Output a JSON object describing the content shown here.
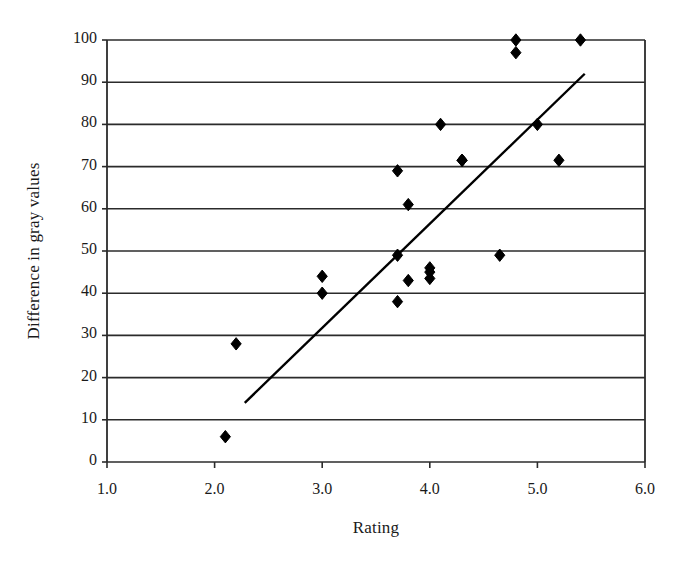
{
  "chart_data": {
    "type": "scatter",
    "title": "",
    "xlabel": "Rating",
    "ylabel": "Difference in gray values",
    "xlim": [
      1.0,
      6.0
    ],
    "ylim": [
      0,
      100
    ],
    "xticks": [
      "1.0",
      "2.0",
      "3.0",
      "4.0",
      "5.0",
      "6.0"
    ],
    "xtick_values": [
      1.0,
      2.0,
      3.0,
      4.0,
      5.0,
      6.0
    ],
    "yticks": [
      "0",
      "10",
      "20",
      "30",
      "40",
      "50",
      "60",
      "70",
      "80",
      "90",
      "100"
    ],
    "ytick_values": [
      0,
      10,
      20,
      30,
      40,
      50,
      60,
      70,
      80,
      90,
      100
    ],
    "grid": "horizontal",
    "legend": "none",
    "marker": "diamond",
    "marker_color": "#000000",
    "points": [
      {
        "x": 2.1,
        "y": 6
      },
      {
        "x": 2.2,
        "y": 28
      },
      {
        "x": 3.0,
        "y": 44
      },
      {
        "x": 3.0,
        "y": 40
      },
      {
        "x": 3.7,
        "y": 69
      },
      {
        "x": 3.7,
        "y": 49
      },
      {
        "x": 3.7,
        "y": 38
      },
      {
        "x": 3.8,
        "y": 61
      },
      {
        "x": 3.8,
        "y": 43
      },
      {
        "x": 4.0,
        "y": 46
      },
      {
        "x": 4.0,
        "y": 45
      },
      {
        "x": 4.0,
        "y": 43.5
      },
      {
        "x": 4.1,
        "y": 80
      },
      {
        "x": 4.3,
        "y": 71.5
      },
      {
        "x": 4.3,
        "y": 71.5
      },
      {
        "x": 4.65,
        "y": 49
      },
      {
        "x": 4.8,
        "y": 100
      },
      {
        "x": 4.8,
        "y": 97
      },
      {
        "x": 5.0,
        "y": 80
      },
      {
        "x": 5.2,
        "y": 71.5
      },
      {
        "x": 5.4,
        "y": 100
      }
    ],
    "trendline": {
      "x0": 2.28,
      "y0": 14,
      "x1": 5.44,
      "y1": 92,
      "color": "#000000"
    }
  }
}
